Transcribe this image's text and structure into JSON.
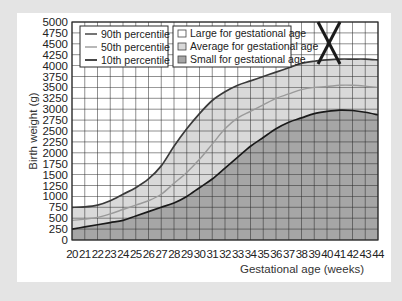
{
  "chart_data": {
    "type": "area",
    "title": "",
    "xlabel": "Gestational age (weeks)",
    "ylabel": "Birth weight (g)",
    "xlim": [
      20,
      44
    ],
    "ylim": [
      0,
      5000
    ],
    "grid": true,
    "legend_position": "top-left",
    "x": [
      20,
      21,
      22,
      23,
      24,
      25,
      26,
      27,
      28,
      29,
      30,
      31,
      32,
      33,
      34,
      35,
      36,
      37,
      38,
      39,
      40,
      41,
      42,
      43,
      44
    ],
    "x_tick_labels": [
      "20",
      "21",
      "22",
      "23",
      "24",
      "25",
      "26",
      "27",
      "28",
      "29",
      "30",
      "31",
      "32",
      "33",
      "34",
      "35",
      "36",
      "37",
      "38",
      "39",
      "40",
      "41",
      "42",
      "43",
      "44"
    ],
    "y_tick_labels": [
      "0",
      "250",
      "500",
      "750",
      "1000",
      "1250",
      "1500",
      "1750",
      "2000",
      "2250",
      "2500",
      "2750",
      "3000",
      "3250",
      "3500",
      "3750",
      "4000",
      "4250",
      "4500",
      "4750",
      "5000"
    ],
    "series": [
      {
        "name": "90th percentile",
        "color": "#3a3a3a",
        "values": [
          750,
          760,
          800,
          900,
          1050,
          1200,
          1400,
          1700,
          2150,
          2550,
          2900,
          3200,
          3400,
          3550,
          3650,
          3750,
          3850,
          3950,
          4050,
          4100,
          4130,
          4150,
          4150,
          4150,
          4130
        ]
      },
      {
        "name": "50th percentile",
        "color": "#9a9a9a",
        "values": [
          450,
          480,
          520,
          600,
          700,
          800,
          900,
          1050,
          1300,
          1550,
          1850,
          2200,
          2550,
          2800,
          2950,
          3100,
          3250,
          3350,
          3450,
          3500,
          3520,
          3550,
          3550,
          3530,
          3500
        ]
      },
      {
        "name": "10th percentile",
        "color": "#1a1a1a",
        "values": [
          250,
          300,
          350,
          400,
          450,
          550,
          650,
          750,
          850,
          1000,
          1200,
          1400,
          1650,
          1900,
          2150,
          2350,
          2550,
          2700,
          2800,
          2900,
          2950,
          2980,
          2970,
          2930,
          2870
        ]
      }
    ],
    "regions": [
      {
        "name": "Large for gestational age",
        "fill": "#ffffff"
      },
      {
        "name": "Average for gestational age",
        "fill": "#d9d9d9"
      },
      {
        "name": "Small for gestational age",
        "fill": "#a6a6a6"
      }
    ],
    "annotations": [
      {
        "type": "cross-mark",
        "text": "X",
        "x_range": [
          38.6,
          40.3
        ],
        "y_range": [
          4050,
          5000
        ]
      }
    ]
  },
  "legend": {
    "lines": [
      "90th percentile",
      "50th percentile",
      "10th percentile"
    ],
    "areas": [
      "Large for gestational age",
      "Average for gestational age",
      "Small for gestational age"
    ]
  },
  "axes": {
    "xlabel": "Gestational age (weeks)",
    "ylabel": "Birth weight (g)"
  },
  "colors": {
    "background": "#e4e4e4",
    "card": "#ffffff",
    "grid": "#2b2b2b",
    "average_fill": "#d9d9d9",
    "small_fill": "#a6a6a6"
  }
}
